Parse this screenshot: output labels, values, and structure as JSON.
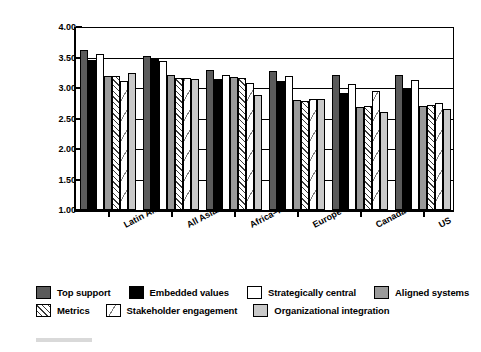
{
  "axis": {
    "ylabel": "Extent (1–5)",
    "yticks": [
      "4.00",
      "3.50",
      "3.00",
      "2.50",
      "2.00",
      "1.50",
      "1.00"
    ],
    "ymin": 1.0,
    "ymax": 4.0
  },
  "legend": {
    "row1": [
      {
        "label": "Top support",
        "key": "top_support",
        "color": "#5b5b5b"
      },
      {
        "label": "Embedded values",
        "key": "embedded_values",
        "color": "#000000"
      },
      {
        "label": "Strategically central",
        "key": "strategically_central",
        "color": "#ffffff"
      },
      {
        "label": "Aligned systems",
        "key": "aligned_systems",
        "color": "#9a9a9a"
      }
    ],
    "row2": [
      {
        "label": "Metrics",
        "key": "metrics",
        "color": "#ffffff"
      },
      {
        "label": "Stakeholder engagement",
        "key": "stakeholder_engagement",
        "color": "#ffffff"
      },
      {
        "label": "Organizational integration",
        "key": "organizational_integration",
        "color": "#c9c9c9"
      }
    ]
  },
  "chart_data": {
    "type": "bar",
    "title": "",
    "xlabel": "",
    "ylabel": "Extent (1–5)",
    "ylim": [
      1.0,
      4.0
    ],
    "ytick_step": 0.5,
    "grid": true,
    "legend_position": "bottom",
    "categories": [
      "Latin America",
      "All Asian",
      "Africa–Middle East",
      "Europe E+W",
      "Canada",
      "US"
    ],
    "series": [
      {
        "name": "Top support",
        "values": [
          3.62,
          3.53,
          3.29,
          3.28,
          3.22,
          3.21
        ]
      },
      {
        "name": "Embedded values",
        "values": [
          3.46,
          3.48,
          3.15,
          3.12,
          2.92,
          2.98
        ]
      },
      {
        "name": "Strategically central",
        "values": [
          3.56,
          3.44,
          3.21,
          3.2,
          3.07,
          3.13
        ]
      },
      {
        "name": "Aligned systems",
        "values": [
          3.19,
          3.22,
          3.18,
          2.81,
          2.69,
          2.71
        ]
      },
      {
        "name": "Metrics",
        "values": [
          3.19,
          3.16,
          3.17,
          2.79,
          2.7,
          2.72
        ]
      },
      {
        "name": "Stakeholder engagement",
        "values": [
          3.11,
          3.17,
          3.09,
          2.82,
          2.95,
          2.75
        ]
      },
      {
        "name": "Organizational integration",
        "values": [
          3.25,
          3.15,
          2.89,
          2.82,
          2.61,
          2.66
        ]
      }
    ]
  }
}
